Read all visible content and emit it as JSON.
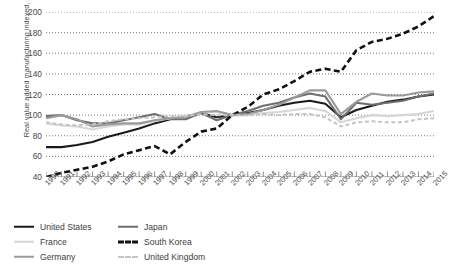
{
  "chart_data": {
    "type": "line",
    "title": "",
    "xlabel": "",
    "ylabel": "Real value added manufacturing indexed, 2002 = 100",
    "ylim": [
      40,
      200
    ],
    "yticks": [
      40,
      60,
      80,
      100,
      120,
      140,
      160,
      180,
      200
    ],
    "grid": "horizontal-dotted",
    "legend_position": "below-left",
    "x": [
      1990,
      1991,
      1992,
      1993,
      1994,
      1995,
      1996,
      1997,
      1998,
      1999,
      2000,
      2001,
      2002,
      2003,
      2004,
      2005,
      2006,
      2007,
      2008,
      2009,
      2010,
      2011,
      2012,
      2013,
      2014,
      2015
    ],
    "xtick_labels": [
      "1990",
      "1991",
      "1992",
      "1993",
      "1994",
      "1995",
      "1996",
      "1997",
      "1998",
      "1999",
      "2000",
      "2001",
      "2002",
      "2003",
      "2004",
      "2005",
      "2006",
      "2007",
      "2008",
      "2009",
      "2010",
      "2011",
      "2012",
      "2013",
      "2014",
      "2015"
    ],
    "series": [
      {
        "name": "United States",
        "color": "#1a1a1a",
        "style": "solid",
        "width": 2.1,
        "values": [
          69,
          69,
          71,
          74,
          79,
          83,
          87,
          92,
          96,
          99,
          102,
          98,
          100,
          102,
          105,
          109,
          112,
          114,
          111,
          98,
          105,
          109,
          113,
          115,
          118,
          120
        ]
      },
      {
        "name": "Japan",
        "color": "#6e6e6e",
        "style": "solid",
        "width": 2.1,
        "values": [
          99,
          100,
          95,
          92,
          92,
          95,
          98,
          101,
          96,
          96,
          102,
          95,
          100,
          104,
          109,
          112,
          117,
          121,
          118,
          96,
          112,
          110,
          112,
          114,
          118,
          121
        ]
      },
      {
        "name": "France",
        "color": "#d6d6d6",
        "style": "solid",
        "width": 2.1,
        "values": [
          92,
          90,
          89,
          86,
          89,
          91,
          91,
          94,
          97,
          99,
          103,
          103,
          100,
          100,
          102,
          103,
          105,
          107,
          104,
          93,
          97,
          100,
          99,
          100,
          101,
          104
        ]
      },
      {
        "name": "South Korea",
        "color": "#111111",
        "style": "dashed",
        "width": 2.6,
        "values": [
          40,
          44,
          47,
          50,
          55,
          62,
          66,
          70,
          62,
          74,
          84,
          87,
          100,
          108,
          120,
          125,
          133,
          142,
          145,
          142,
          163,
          171,
          174,
          179,
          186,
          196
        ]
      },
      {
        "name": "Germany",
        "color": "#9a9a9a",
        "style": "solid",
        "width": 2.1,
        "values": [
          97,
          100,
          96,
          89,
          91,
          92,
          92,
          95,
          97,
          98,
          103,
          104,
          100,
          101,
          105,
          110,
          117,
          124,
          124,
          101,
          113,
          121,
          119,
          119,
          122,
          123
        ]
      },
      {
        "name": "United Kingdom",
        "color": "#c4c4c4",
        "style": "dashed",
        "width": 2.0,
        "values": [
          93,
          91,
          90,
          91,
          94,
          96,
          97,
          98,
          99,
          99,
          101,
          100,
          100,
          100,
          101,
          100,
          101,
          101,
          98,
          89,
          93,
          94,
          93,
          93,
          96,
          97
        ]
      }
    ]
  },
  "legend": {
    "columns": [
      [
        {
          "label": "United States",
          "swatch": "solid-black-thick"
        },
        {
          "label": "France",
          "swatch": "solid-lightgray"
        },
        {
          "label": "Germany",
          "swatch": "solid-gray"
        }
      ],
      [
        {
          "label": "Japan",
          "swatch": "solid-darkgray"
        },
        {
          "label": "South Korea",
          "swatch": "dashed-black-thick"
        },
        {
          "label": "United Kingdom",
          "swatch": "dashed-lightgray"
        }
      ]
    ]
  }
}
